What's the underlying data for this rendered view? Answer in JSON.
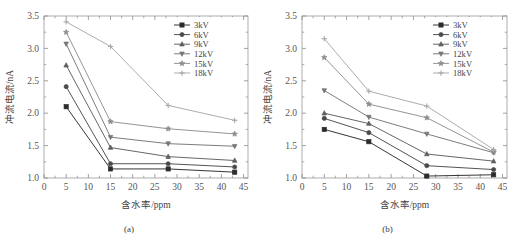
{
  "figure": {
    "title": "",
    "panels": [
      {
        "caption": "(a)"
      },
      {
        "caption": "(b)"
      }
    ]
  },
  "axis": {
    "xlabel": "含水率/ppm",
    "ylabel": "冲流电流/nA",
    "x_ticks": [
      "0",
      "5",
      "10",
      "15",
      "20",
      "25",
      "30",
      "35",
      "40",
      "45"
    ],
    "y_ticks": [
      "1.0",
      "1.5",
      "2.0",
      "2.5",
      "3.0",
      "3.5"
    ]
  },
  "legend": {
    "entries": [
      {
        "label": "3kV",
        "marker": "square",
        "color": "#2b2b2b"
      },
      {
        "label": "6kV",
        "marker": "circle",
        "color": "#4a4a4a"
      },
      {
        "label": "9kV",
        "marker": "triangle-up",
        "color": "#5e5e5e"
      },
      {
        "label": "12kV",
        "marker": "triangle-down",
        "color": "#767676"
      },
      {
        "label": "15kV",
        "marker": "star",
        "color": "#8e8e8e"
      },
      {
        "label": "18kV",
        "marker": "plus",
        "color": "#a8a8a8"
      }
    ]
  },
  "chart_data": [
    {
      "type": "line",
      "title": "(a)",
      "xlabel": "含水率/ppm",
      "ylabel": "冲流电流/nA",
      "xlim": [
        0,
        46
      ],
      "ylim": [
        1.0,
        3.5
      ],
      "grid": false,
      "legend_position": "top-right",
      "x": [
        5,
        15,
        28,
        43
      ],
      "series": [
        {
          "name": "3kV",
          "values": [
            2.1,
            1.14,
            1.14,
            1.09
          ]
        },
        {
          "name": "6kV",
          "values": [
            2.41,
            1.22,
            1.22,
            1.17
          ]
        },
        {
          "name": "9kV",
          "values": [
            2.74,
            1.47,
            1.33,
            1.27
          ]
        },
        {
          "name": "12kV",
          "values": [
            3.07,
            1.63,
            1.53,
            1.49
          ]
        },
        {
          "name": "15kV",
          "values": [
            3.25,
            1.87,
            1.76,
            1.68
          ]
        },
        {
          "name": "18kV",
          "values": [
            3.41,
            3.03,
            2.12,
            1.89
          ]
        }
      ]
    },
    {
      "type": "line",
      "title": "(b)",
      "xlabel": "含水率/ppm",
      "ylabel": "冲流电流/nA",
      "xlim": [
        0,
        46
      ],
      "ylim": [
        1.0,
        3.5
      ],
      "grid": false,
      "legend_position": "top-right",
      "x": [
        5,
        15,
        28,
        43
      ],
      "series": [
        {
          "name": "3kV",
          "values": [
            1.75,
            1.56,
            1.03,
            1.05
          ]
        },
        {
          "name": "6kV",
          "values": [
            1.92,
            1.7,
            1.19,
            1.13
          ]
        },
        {
          "name": "9kV",
          "values": [
            2.0,
            1.84,
            1.37,
            1.26
          ]
        },
        {
          "name": "12kV",
          "values": [
            2.35,
            1.94,
            1.68,
            1.39
          ]
        },
        {
          "name": "15kV",
          "values": [
            2.86,
            2.14,
            1.93,
            1.4
          ]
        },
        {
          "name": "18kV",
          "values": [
            3.15,
            2.34,
            2.11,
            1.44
          ]
        }
      ]
    }
  ]
}
